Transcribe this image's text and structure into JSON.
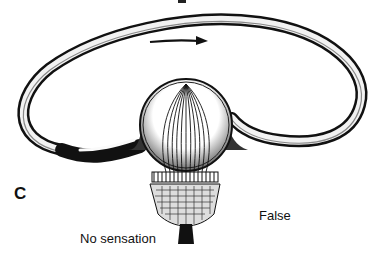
{
  "figure": {
    "panel_letter": "C",
    "labels": {
      "false": "False",
      "no_sensation": "No sensation"
    },
    "icons": {
      "flow_arrow": "arrow-right-icon"
    },
    "colors": {
      "ink": "#111111",
      "background": "#ffffff",
      "shade": "#555555"
    }
  }
}
